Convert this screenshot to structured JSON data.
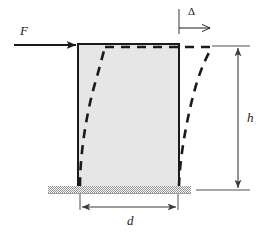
{
  "labels": {
    "force": "F",
    "deflection": "Δ",
    "height": "h",
    "width": "d"
  },
  "colors": {
    "stroke": "#1a1a1a",
    "block_fill": "#e6e6e6",
    "ground_hatch": "#9a9a9a",
    "dimension_line": "#3a3a3a",
    "background": "#ffffff"
  },
  "geometry": {
    "block": {
      "left": 78,
      "right": 179,
      "top": 44,
      "bottom": 187,
      "width": 101,
      "height": 143
    },
    "force_arrow": {
      "x1": 14,
      "y1": 45,
      "x2": 78,
      "y2": 45
    },
    "delta_arrow": {
      "tick_x": 179,
      "tick_y1": 10,
      "tick_y2": 34,
      "x1": 179,
      "y1": 28,
      "x2": 212,
      "y2": 28
    },
    "ground": {
      "left": 48,
      "right": 191,
      "top": 186,
      "bottom": 193
    },
    "height_dimension": {
      "x": 238,
      "y1": 46,
      "y2": 190
    },
    "width_dimension": {
      "y": 207,
      "x1": 80,
      "x2": 178
    },
    "deformed_left_curve": {
      "bottom_x": 80,
      "top_x": 105
    },
    "deformed_right_curve": {
      "bottom_x": 179,
      "top_x": 212
    },
    "deformed_top": {
      "x1": 105,
      "x2": 212,
      "y": 47
    }
  }
}
